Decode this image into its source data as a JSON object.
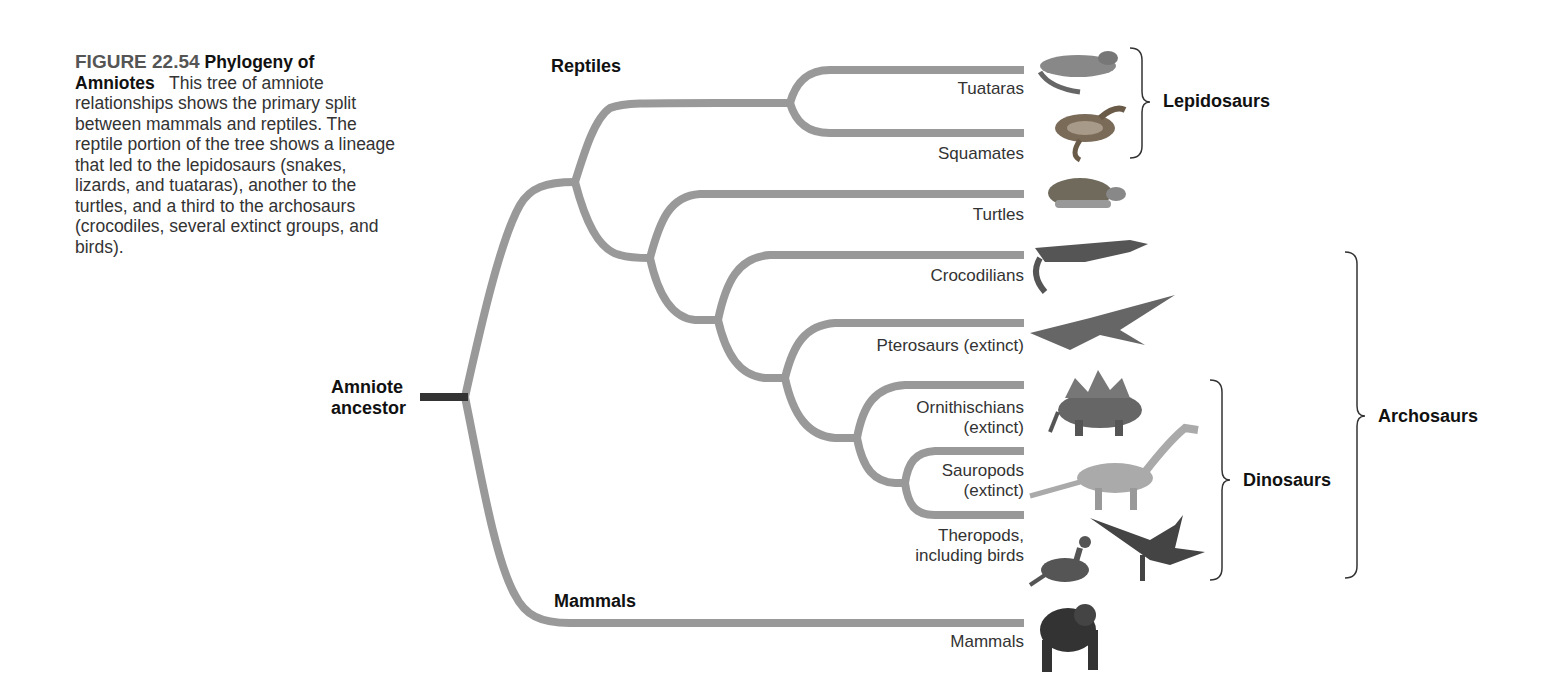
{
  "caption": {
    "figure_number": "FIGURE 22.54",
    "title": "Phylogeny of Amniotes",
    "text": "This tree of amniote relationships shows the primary split between mammals and reptiles. The reptile portion of the tree shows a lineage that led to the lepidosaurs (snakes, lizards, and tuataras), another to the turtles, and a third to the archosaurs (crocodiles, several extinct groups, and birds)."
  },
  "tree": {
    "root_label_line1": "Amniote",
    "root_label_line2": "ancestor",
    "group_reptiles": "Reptiles",
    "group_mammals": "Mammals",
    "line_color": "#999999",
    "root_color": "#333333"
  },
  "tips": [
    {
      "id": "tuataras",
      "label": "Tuataras",
      "icon": "tuatara-icon"
    },
    {
      "id": "squamates",
      "label": "Squamates",
      "icon": "snake-icon"
    },
    {
      "id": "turtles",
      "label": "Turtles",
      "icon": "turtle-icon"
    },
    {
      "id": "crocodilians",
      "label": "Crocodilians",
      "icon": "crocodile-icon"
    },
    {
      "id": "pterosaurs",
      "label": "Pterosaurs (extinct)",
      "icon": "pterosaur-icon"
    },
    {
      "id": "ornithischians",
      "label_line1": "Ornithischians",
      "label_line2": "(extinct)",
      "icon": "stegosaurus-icon"
    },
    {
      "id": "sauropods",
      "label_line1": "Sauropods",
      "label_line2": "(extinct)",
      "icon": "sauropod-icon"
    },
    {
      "id": "theropods",
      "label_line1": "Theropods,",
      "label_line2": "including birds",
      "icon": "theropod-bird-icon"
    },
    {
      "id": "mammals",
      "label": "Mammals",
      "icon": "chimpanzee-icon"
    }
  ],
  "brackets": {
    "lepidosaurs": "Lepidosaurs",
    "dinosaurs": "Dinosaurs",
    "archosaurs": "Archosaurs"
  }
}
